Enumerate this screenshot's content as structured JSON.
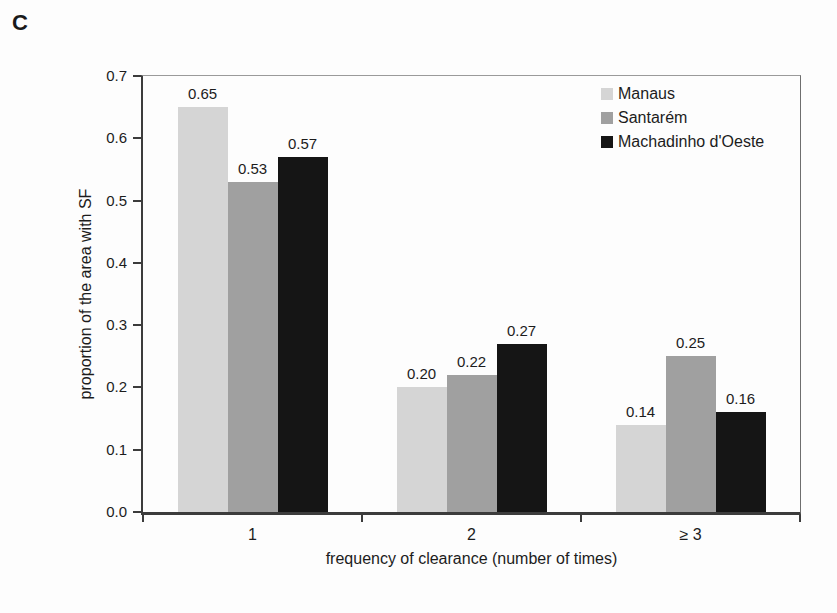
{
  "figure_label": "C",
  "chart_data": {
    "type": "bar",
    "title": "",
    "xlabel": "frequency of clearance (number of times)",
    "ylabel": "proportion of the area with SF",
    "categories": [
      "1",
      "2",
      "≥ 3"
    ],
    "series": [
      {
        "name": "Manaus",
        "color": "#d5d5d5",
        "values": [
          0.65,
          0.2,
          0.14
        ]
      },
      {
        "name": "Santarém",
        "color": "#a0a0a0",
        "values": [
          0.53,
          0.22,
          0.25
        ]
      },
      {
        "name": "Machadinho d'Oeste",
        "color": "#151515",
        "values": [
          0.57,
          0.27,
          0.16
        ]
      }
    ],
    "value_labels": [
      [
        "0.65",
        "0.20",
        "0.14"
      ],
      [
        "0.53",
        "0.22",
        "0.25"
      ],
      [
        "0.57",
        "0.27",
        "0.16"
      ]
    ],
    "ylim": [
      0,
      0.7
    ],
    "ytick_labels": [
      "0.0",
      "0.1",
      "0.2",
      "0.3",
      "0.4",
      "0.5",
      "0.6",
      "0.7"
    ],
    "grid": false,
    "legend_position": "top-right-inside",
    "axis_color": "#3c3c3c"
  }
}
